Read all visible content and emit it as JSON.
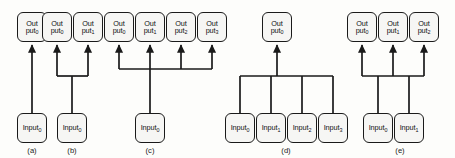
{
  "figure": {
    "type": "diagram",
    "node_labels": {
      "output_prefix": "Out",
      "output_suffix": "put",
      "input_text": "Input"
    },
    "colors": {
      "stroke": "#1a1a1a",
      "node_fill": "#f6f6f4",
      "background": "#fdfdfb"
    },
    "groups": [
      {
        "id": "a",
        "caption": "(a)",
        "topology": "one-to-one",
        "outputs": [
          {
            "name": "Output0",
            "sub": "0",
            "x": 32,
            "y": 12
          }
        ],
        "inputs": [
          {
            "name": "Input0",
            "sub": "0",
            "x": 32,
            "y": 113
          }
        ],
        "caption_x": 32,
        "caption_y": 146
      },
      {
        "id": "b",
        "caption": "(b)",
        "topology": "one-to-two fan-out",
        "outputs": [
          {
            "name": "Output0",
            "sub": "0",
            "x": 57,
            "y": 12
          },
          {
            "name": "Output1",
            "sub": "1",
            "x": 88,
            "y": 12
          }
        ],
        "inputs": [
          {
            "name": "Input0",
            "sub": "0",
            "x": 72,
            "y": 113
          }
        ],
        "bus_y": 76,
        "caption_x": 72,
        "caption_y": 146
      },
      {
        "id": "c",
        "caption": "(c)",
        "topology": "one-to-four fan-out",
        "outputs": [
          {
            "name": "Output0",
            "sub": "0",
            "x": 119,
            "y": 12
          },
          {
            "name": "Output1",
            "sub": "1",
            "x": 150,
            "y": 12
          },
          {
            "name": "Output2",
            "sub": "2",
            "x": 181,
            "y": 12
          },
          {
            "name": "Output3",
            "sub": "3",
            "x": 212,
            "y": 12
          }
        ],
        "inputs": [
          {
            "name": "Input0",
            "sub": "0",
            "x": 150,
            "y": 113
          }
        ],
        "bus_y": 69,
        "caption_x": 150,
        "caption_y": 146
      },
      {
        "id": "d",
        "caption": "(d)",
        "topology": "four-to-one fan-in",
        "outputs": [
          {
            "name": "Output0",
            "sub": "0",
            "x": 277,
            "y": 12
          }
        ],
        "inputs": [
          {
            "name": "Input0",
            "sub": "0",
            "x": 240,
            "y": 113
          },
          {
            "name": "Input1",
            "sub": "1",
            "x": 271,
            "y": 113
          },
          {
            "name": "Input2",
            "sub": "2",
            "x": 302,
            "y": 113
          },
          {
            "name": "Input3",
            "sub": "3",
            "x": 333,
            "y": 113
          }
        ],
        "bus_y": 76,
        "caption_x": 286,
        "caption_y": 146
      },
      {
        "id": "e",
        "caption": "(e)",
        "topology": "two-to-three many-to-many",
        "outputs": [
          {
            "name": "Output0",
            "sub": "0",
            "x": 362,
            "y": 12
          },
          {
            "name": "Output1",
            "sub": "1",
            "x": 393,
            "y": 12
          },
          {
            "name": "Output2",
            "sub": "2",
            "x": 424,
            "y": 12
          }
        ],
        "inputs": [
          {
            "name": "Input0",
            "sub": "0",
            "x": 378,
            "y": 113
          },
          {
            "name": "Input1",
            "sub": "1",
            "x": 409,
            "y": 113
          }
        ],
        "bus_y": 76,
        "caption_x": 400,
        "caption_y": 146
      }
    ]
  }
}
